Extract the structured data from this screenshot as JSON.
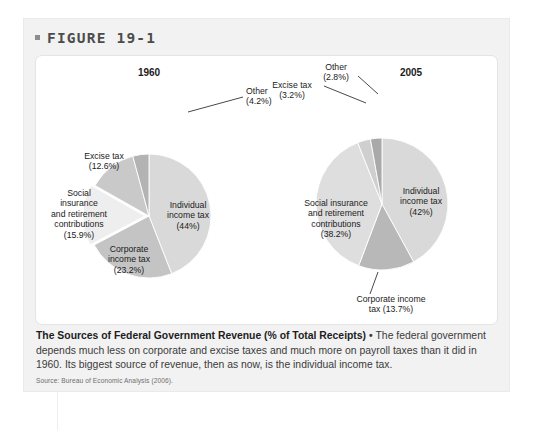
{
  "figure": {
    "header_label": "FIGURE 19-1",
    "bullet_icon": "square-bullet-icon"
  },
  "caption": {
    "title": "The Sources of Federal Government Revenue (% of Total Receipts)",
    "separator": " • ",
    "body": "The federal government depends much less on corporate and excise taxes and much more on payroll taxes than it did in 1960. Its biggest source of revenue, then as now, is the individual income tax.",
    "source": "Source: Bureau of Economic Analysis (2006)."
  },
  "colors": {
    "panel_bg": "#f2f2f2",
    "card_bg": "#ffffff",
    "slice_light": "#d9d9d9",
    "slice_mid": "#c4c4c4",
    "slice_dark": "#b0b0b0",
    "slice_pale": "#e6e6e6",
    "text": "#1b1b1b",
    "leader": "#1b1b1b"
  },
  "chart_data": [
    {
      "type": "pie",
      "title": "1960",
      "xlabel": "",
      "ylabel": "",
      "legend": "none",
      "grid": false,
      "units": "% of Total Receipts",
      "categories": [
        "Individual income tax",
        "Corporate income tax",
        "Social insurance and retirement contributions",
        "Excise tax",
        "Other"
      ],
      "values": [
        44,
        23.2,
        15.9,
        12.6,
        4.2
      ],
      "value_labels": [
        "(44%)",
        "(23.2%)",
        "(15.9%)",
        "(12.6%)",
        "(4.2%)"
      ],
      "slice_labels": [
        "Individual\nincome tax\n(44%)",
        "Corporate\nincome tax\n(23.2%)",
        "Social\ninsurance\nand retirement\ncontributions\n(15.9%)",
        "Excise tax\n(12.6%)",
        "Other\n(4.2%)"
      ],
      "slice_colors": [
        "#d9d9d9",
        "#c4c4c4",
        "#eeeeee",
        "#c9c9c9",
        "#b3b3b3"
      ],
      "callouts": [
        "Other"
      ]
    },
    {
      "type": "pie",
      "title": "2005",
      "xlabel": "",
      "ylabel": "",
      "legend": "none",
      "grid": false,
      "units": "% of Total Receipts",
      "categories": [
        "Individual income tax",
        "Corporate income tax",
        "Social insurance and retirement contributions",
        "Excise tax",
        "Other"
      ],
      "values": [
        42,
        13.7,
        38.2,
        3.2,
        2.8
      ],
      "value_labels": [
        "(42%)",
        "(13.7%)",
        "(38.2%)",
        "(3.2%)",
        "(2.8%)"
      ],
      "slice_labels": [
        "Individual\nincome tax\n(42%)",
        "Corporate income\ntax (13.7%)",
        "Social insurance\nand retirement\ncontributions\n(38.2%)",
        "Excise tax\n(3.2%)",
        "Other\n(2.8%)"
      ],
      "slice_colors": [
        "#d9d9d9",
        "#b8b8b8",
        "#dedede",
        "#cfcfcf",
        "#a9a9a9"
      ],
      "callouts": [
        "Corporate income tax",
        "Excise tax",
        "Other"
      ]
    }
  ]
}
